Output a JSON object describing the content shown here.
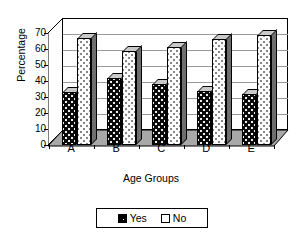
{
  "chart_data": {
    "type": "bar",
    "title": "",
    "xlabel": "Age Groups",
    "ylabel": "Percentage",
    "categories": [
      "A",
      "B",
      "C",
      "D",
      "E"
    ],
    "series": [
      {
        "name": "Yes",
        "values": [
          33,
          42,
          38,
          34,
          32
        ],
        "color": "#000000"
      },
      {
        "name": "No",
        "values": [
          67,
          59,
          61,
          66,
          69
        ],
        "color": "#ffffff"
      }
    ],
    "ylim": [
      0,
      70
    ],
    "yticks": [
      0,
      10,
      20,
      30,
      40,
      50,
      60,
      70
    ],
    "ytick_labels": [
      "0",
      "10",
      "20",
      "30",
      "40",
      "50",
      "60",
      "70"
    ],
    "grid": true,
    "legend_position": "bottom",
    "style": "3d-column"
  },
  "legend": {
    "entries": [
      {
        "label": "Yes",
        "swatch": "filled-dark-swatch"
      },
      {
        "label": "No",
        "swatch": "empty-light-swatch"
      }
    ]
  }
}
